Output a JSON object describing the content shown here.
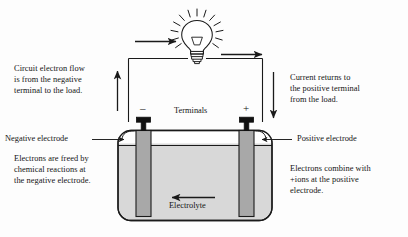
{
  "diagram": {
    "type": "schematic",
    "colors": {
      "background": "#fdfdfd",
      "stroke": "#1a1a1a",
      "electrolyte_fill": "#d8d8d8",
      "electrode_fill": "#a8a8a8",
      "terminal_fill": "#111111",
      "text": "#141414"
    }
  },
  "notes": {
    "left_top": "Circuit electron flow\nis from the negative\nterminal to the load.",
    "right_top": "Current returns to\nthe positive terminal\nfrom the load.",
    "left_bottom": "Electrons are freed by\nchemical reactions at\nthe negative electrode.",
    "right_bottom": "Electrons combine with\n+ions at the positive\nelectrode."
  },
  "labels": {
    "terminals": "Terminals",
    "negative_electrode": "Negative electrode",
    "positive_electrode": "Positive electrode",
    "electrolyte": "Electrolyte",
    "minus_sign": "–",
    "plus_sign": "+"
  },
  "icons": {
    "lamp": "light-bulb-icon",
    "flow_arrow_left": "electron-flow-up-arrow",
    "flow_arrow_top_left": "electron-flow-right-arrow",
    "flow_arrow_top_right": "current-return-right-arrow",
    "flow_arrow_right": "current-return-down-arrow",
    "electrolyte_arrow": "electrolyte-flow-left-arrow"
  }
}
